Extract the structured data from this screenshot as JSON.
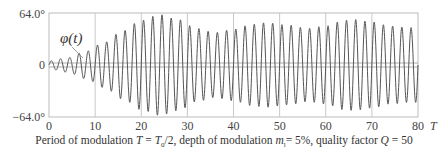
{
  "chart_data": {
    "type": "line",
    "title": "",
    "xlabel": "T",
    "ylabel": "φ(t)",
    "series_label": "φ(t)",
    "xlim": [
      0,
      80
    ],
    "ylim": [
      -64.0,
      64.0
    ],
    "y_unit": "°",
    "x_ticks": [
      "0",
      "10",
      "20",
      "30",
      "40",
      "50",
      "60",
      "70",
      "80"
    ],
    "y_ticks": [
      "64.0°",
      "0",
      "−64.0°"
    ],
    "grid": "vertical lines every 10 units",
    "oscillation_period": 2.0,
    "envelope": {
      "t": [
        0,
        4,
        8,
        12,
        16,
        20,
        24,
        28,
        32,
        36,
        40,
        44,
        47,
        52,
        56,
        60,
        64,
        66,
        70,
        74,
        78,
        80
      ],
      "amplitude": [
        5,
        9,
        17,
        28,
        42,
        55,
        62,
        56,
        45,
        40,
        44,
        50,
        52,
        49,
        45,
        48,
        55,
        56,
        53,
        48,
        46,
        46
      ]
    },
    "caption": {
      "prefix": "Period of modulation ",
      "T": "T",
      "eq": " = ",
      "T0": "T",
      "T0_sub": "0",
      "div": "/2, depth of modulation ",
      "m": "m",
      "m_sub": "l",
      "m_val": "= 5%, quality factor ",
      "Q": "Q",
      "Q_val": " = 50"
    }
  }
}
